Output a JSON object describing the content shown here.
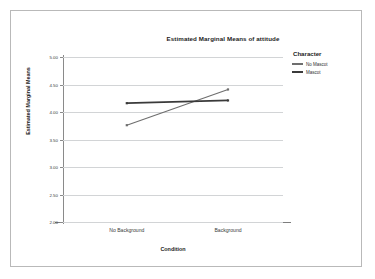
{
  "chart_data": {
    "type": "line",
    "title": "Estimated Marginal Means of attitude",
    "xlabel": "Condition",
    "ylabel": "Estimated Marginal Means",
    "categories": [
      "No Background",
      "Background"
    ],
    "series": [
      {
        "name": "No Mascot",
        "values": [
          3.76,
          4.41
        ],
        "color": "#6e6e6e",
        "width": 1.1
      },
      {
        "name": "Mascot",
        "values": [
          4.16,
          4.21
        ],
        "color": "#3a3a3a",
        "width": 1.7
      }
    ],
    "ylim": [
      2.0,
      5.0
    ],
    "yticks": [
      5.0,
      4.5,
      4.0,
      3.5,
      3.0,
      2.5,
      2.0
    ],
    "ytick_labels": [
      "5.00",
      "4.50",
      "4.00",
      "3.50",
      "3.00",
      "2.50",
      "2.00"
    ],
    "grid": true,
    "legend_position": "right",
    "legend_title": "Character"
  },
  "legend": {
    "title": "Character",
    "entries": [
      {
        "label": "No Mascot"
      },
      {
        "label": "Mascot"
      }
    ]
  },
  "axes": {
    "x_title": "Condition",
    "y_title": "Estimated Marginal Means",
    "x_tick_labels": [
      "No Background",
      "Background"
    ],
    "y_tick_labels": [
      "5.00",
      "4.50",
      "4.00",
      "3.50",
      "3.00",
      "2.50",
      "2.00"
    ]
  },
  "colors": {
    "grid": "#d2d4d6",
    "axis": "#8a8a8a",
    "frame": "#b9b9b9",
    "text": "#1c1c1c",
    "series_no_mascot": "#6e6e6e",
    "series_mascot": "#3a3a3a"
  }
}
